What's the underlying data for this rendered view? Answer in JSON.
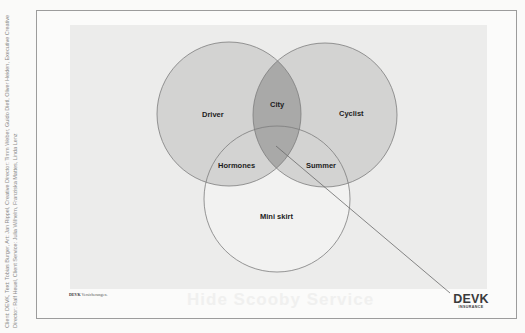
{
  "credits": {
    "line1": "Client: DEVK, Text: Tobias Burger, Art: Jan Rippel, Creative Director: Timm Weber, Guido Dietl, Oliver Heiden, Executive Creative",
    "line2": "Director: Ralf Heuel, Client Service: Julia Wilhelm, Franziska Mattes, Linda Lenz"
  },
  "venn": {
    "circles": [
      {
        "id": "driver",
        "label": "Driver",
        "cx": 229,
        "cy": 114,
        "r": 72,
        "fill": "#d3d3d2"
      },
      {
        "id": "cyclist",
        "label": "Cyclist",
        "cx": 325,
        "cy": 115,
        "r": 72,
        "fill": "#d3d3d2"
      },
      {
        "id": "mini-skirt",
        "label": "Mini skirt",
        "cx": 277,
        "cy": 199,
        "r": 73,
        "fill": "#f2f2f1"
      }
    ],
    "intersections": {
      "driver_cyclist": "City",
      "driver_miniskirt": "Hormones",
      "cyclist_miniskirt": "Summer"
    },
    "colors": {
      "single": "#d3d3d2",
      "overlap_two": "#a9a9a8",
      "mini_skirt": "#f2f2f1",
      "stroke": "#7c7c7c",
      "billboard": "#ececeb"
    },
    "pointer_line": {
      "x1": 276,
      "y1": 146,
      "x2": 450,
      "y2": 293
    }
  },
  "caption": {
    "brand": "DEVK",
    "text": "Versicherungen."
  },
  "ghost_text": "Hide Scooby Service",
  "logo": {
    "main": "DEVK",
    "sub": "INSURANCE"
  }
}
